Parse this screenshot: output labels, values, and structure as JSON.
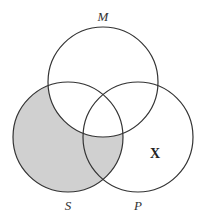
{
  "diagram": {
    "type": "venn",
    "sets": [
      {
        "id": "M",
        "label": "M",
        "cx": 103,
        "cy": 82,
        "r": 55
      },
      {
        "id": "S",
        "label": "S",
        "cx": 68,
        "cy": 137,
        "r": 55
      },
      {
        "id": "P",
        "label": "P",
        "cx": 138,
        "cy": 137,
        "r": 55
      }
    ],
    "shaded_region": "S minus M",
    "shade_color": "#d0d0d0",
    "stroke_color": "#333333",
    "marker": {
      "label": "X",
      "region": "P only"
    }
  }
}
